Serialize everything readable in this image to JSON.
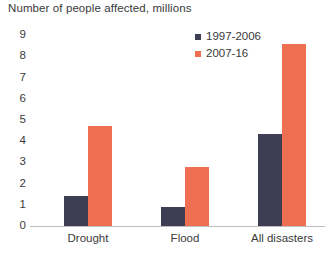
{
  "chart_data": {
    "type": "bar",
    "title": "Number of people affected, millions",
    "xlabel": "",
    "ylabel": "",
    "categories": [
      "Drought",
      "Flood",
      "All disasters"
    ],
    "series": [
      {
        "name": "1997-2006",
        "color": "#3d3d54",
        "values": [
          1.4,
          0.9,
          4.35
        ]
      },
      {
        "name": "2007-16",
        "color": "#ee6f52",
        "values": [
          4.7,
          2.8,
          8.6
        ]
      }
    ],
    "ylim": [
      0,
      9
    ],
    "yticks": [
      9,
      8,
      7,
      6,
      5,
      4,
      3,
      2,
      1,
      0
    ],
    "ytick_labels": [
      "9",
      "8",
      "7",
      "6",
      "5",
      "4",
      "3",
      "2",
      "1",
      "0"
    ],
    "grid": false,
    "legend_position": "top-right"
  }
}
